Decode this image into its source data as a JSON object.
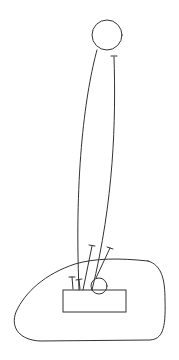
{
  "diagram": {
    "type": "line-drawing",
    "stroke_color": "#333333",
    "background": "#ffffff",
    "elements": [
      {
        "name": "top-circle",
        "shape": "circle",
        "cx": 107,
        "cy": 35,
        "r": 15
      },
      {
        "name": "small-circle",
        "shape": "circle",
        "cx": 99,
        "cy": 286,
        "r": 8
      },
      {
        "name": "rectangle",
        "shape": "rect",
        "x": 63,
        "y": 290,
        "width": 63,
        "height": 22
      },
      {
        "name": "outer-blob",
        "shape": "closed-curve"
      },
      {
        "name": "left-long-curve",
        "shape": "curve"
      },
      {
        "name": "right-long-curve",
        "shape": "curve"
      },
      {
        "name": "pins",
        "shape": "t-lines",
        "count": 4
      }
    ]
  }
}
